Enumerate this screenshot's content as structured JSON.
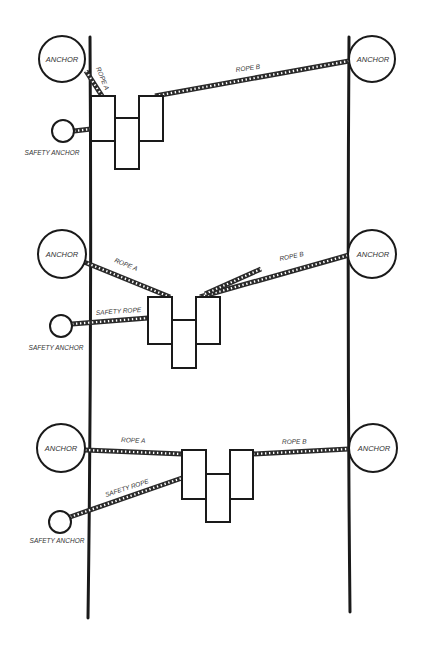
{
  "diagram": {
    "title": "",
    "colors": {
      "ink": "#1a1a1a",
      "background": "#ffffff"
    },
    "panels": [
      {
        "id": "panel-1",
        "labels": {
          "left_anchor": "ANCHOR",
          "right_anchor": "ANCHOR",
          "safety_anchor": "SAFETY ANCHOR",
          "rope_a": "ROPE A",
          "rope_b": "ROPE B",
          "safety_rope": ""
        }
      },
      {
        "id": "panel-2",
        "labels": {
          "left_anchor": "ANCHOR",
          "right_anchor": "ANCHOR",
          "safety_anchor": "SAFETY ANCHOR",
          "rope_a": "ROPE A",
          "rope_b": "ROPE B",
          "safety_rope": "SAFETY ROPE"
        }
      },
      {
        "id": "panel-3",
        "labels": {
          "left_anchor": "ANCHOR",
          "right_anchor": "ANCHOR",
          "safety_anchor": "SAFETY ANCHOR",
          "rope_a": "ROPE A",
          "rope_b": "ROPE B",
          "safety_rope": "SAFETY ROPE"
        }
      }
    ]
  }
}
